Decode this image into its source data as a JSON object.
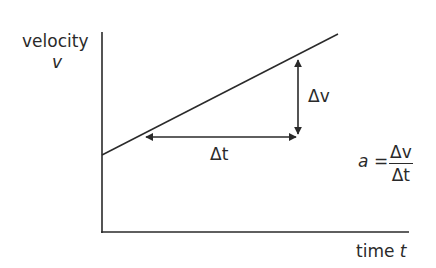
{
  "diagram": {
    "type": "velocity-time graph",
    "y_axis": {
      "label": "velocity",
      "symbol": "v"
    },
    "x_axis": {
      "label": "time",
      "symbol": "t"
    },
    "delta_v_label": "Δv",
    "delta_t_label": "Δt",
    "formula": {
      "lhs": "a",
      "equals": "=",
      "numerator": "Δv",
      "denominator": "Δt"
    },
    "colors": {
      "ink": "#2a2a2a",
      "background": "#ffffff"
    }
  }
}
